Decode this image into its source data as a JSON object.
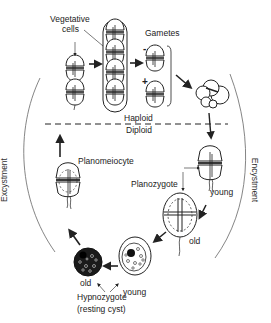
{
  "diagram": {
    "labels": {
      "vegetative": "Vegetative",
      "cells": "cells",
      "gametes": "Gametes",
      "minus_sign": "-",
      "plus_sign": "+",
      "haploid": "Haploid",
      "diploid": "Diploid",
      "planomeiocyte": "Planomeiocyte",
      "planozygote": "Planozygote",
      "young_planozygote": "young",
      "old_planozygote": "old",
      "old_hypnozygote": "old",
      "young_hypnozygote": "young",
      "hypnozygote": "Hypnozygote",
      "resting_cyst": "(resting cyst)",
      "excystment": "Excystment",
      "encystment": "Encystment"
    },
    "stages": [
      "Vegetative cells (2-cell chain)",
      "Vegetative cells (long chain)",
      "Gametes (-/+)",
      "Gamete fusion",
      "Young planozygote",
      "Old planozygote",
      "Young hypnozygote",
      "Old hypnozygote",
      "Planomeiocyte"
    ],
    "colors": {
      "line": "#222222",
      "arc": "#666666",
      "cyst_fill": "#1a1a1a"
    }
  }
}
